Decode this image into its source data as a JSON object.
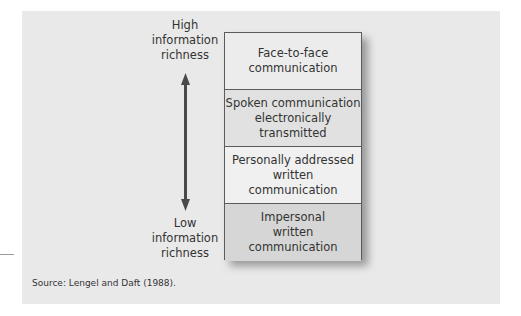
{
  "axis": {
    "high_label": [
      "High",
      "information",
      "richness"
    ],
    "low_label": [
      "Low",
      "information",
      "richness"
    ],
    "arrow": "double-headed-vertical-arrow",
    "arrow_color": "#4a4a4a"
  },
  "media": [
    {
      "lines": [
        "Face-to-face",
        "communication"
      ],
      "fill": "#ececec"
    },
    {
      "lines": [
        "Spoken communication",
        "electronically",
        "transmitted"
      ],
      "fill": "#e1e1e1"
    },
    {
      "lines": [
        "Personally addressed",
        "written",
        "communication"
      ],
      "fill": "#f0f0f0"
    },
    {
      "lines": [
        "Impersonal",
        "written",
        "communication"
      ],
      "fill": "#d6d6d6"
    }
  ],
  "source": "Source: Lengel and Daft (1988).",
  "colors": {
    "panel_background": "#e9e9e9",
    "border": "#5b5b5b",
    "text": "#333333"
  }
}
